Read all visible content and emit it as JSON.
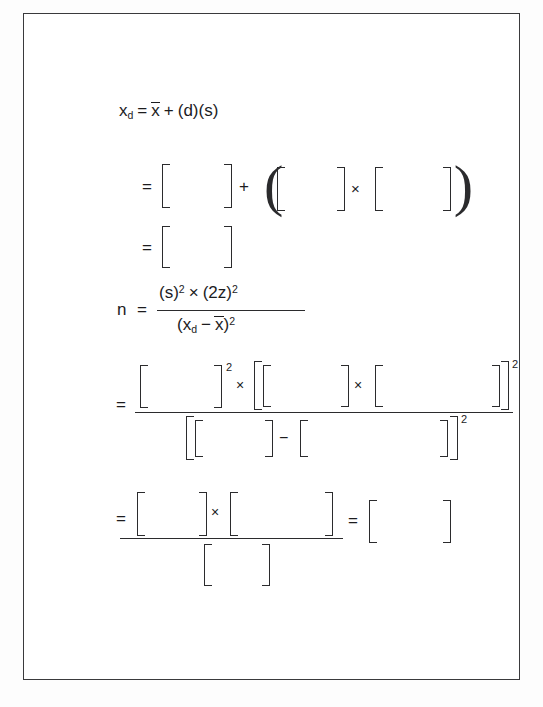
{
  "document": {
    "type": "worksheet-page",
    "title": "Statistics formula worksheet with blank answer brackets",
    "background_color": "#ffffff",
    "border_color": "#3a3a3c",
    "ink_color": "#1c1c1e"
  },
  "formulas": {
    "line1": {
      "name": "xd-definition",
      "variable": "x",
      "variable_subscript": "d",
      "equals": "=",
      "mean_symbol": "x",
      "plus": "+",
      "terms": "(d)(s)"
    },
    "line2": {
      "equals": "=",
      "plus": "+",
      "times": "×",
      "blank_count": 3
    },
    "line3": {
      "equals": "=",
      "blank_count": 1
    },
    "line4": {
      "name": "sample-size-formula",
      "lhs": "n",
      "equals": "=",
      "numerator": "(s)² × (2z)²",
      "numerator_parts": {
        "s_base": "(s)",
        "s_exp": "2",
        "times": "×",
        "z_base": "(2z)",
        "z_exp": "2"
      },
      "denominator": "(xₔ − x̄)²",
      "denominator_parts": {
        "open": "(",
        "x": "x",
        "sub": "d",
        "minus": "−",
        "mean": "x",
        "close": ")",
        "exp": "2"
      }
    },
    "line5": {
      "equals": "=",
      "numerator_exp1": "2",
      "numerator_times1": "×",
      "numerator_times2": "×",
      "numerator_exp2": "2",
      "denominator_minus": "−",
      "denominator_exp": "2",
      "numerator_blank_count": 3,
      "denominator_blank_count": 2
    },
    "line6": {
      "equals": "=",
      "times": "×",
      "equals2": "=",
      "numerator_blank_count": 2,
      "denominator_blank_count": 1,
      "result_blank_count": 1
    }
  },
  "symbols": {
    "multiplication": "×",
    "minus": "−",
    "plus": "+",
    "equals": "=",
    "open_paren": "(",
    "close_paren": ")",
    "superscript_two": "2"
  }
}
